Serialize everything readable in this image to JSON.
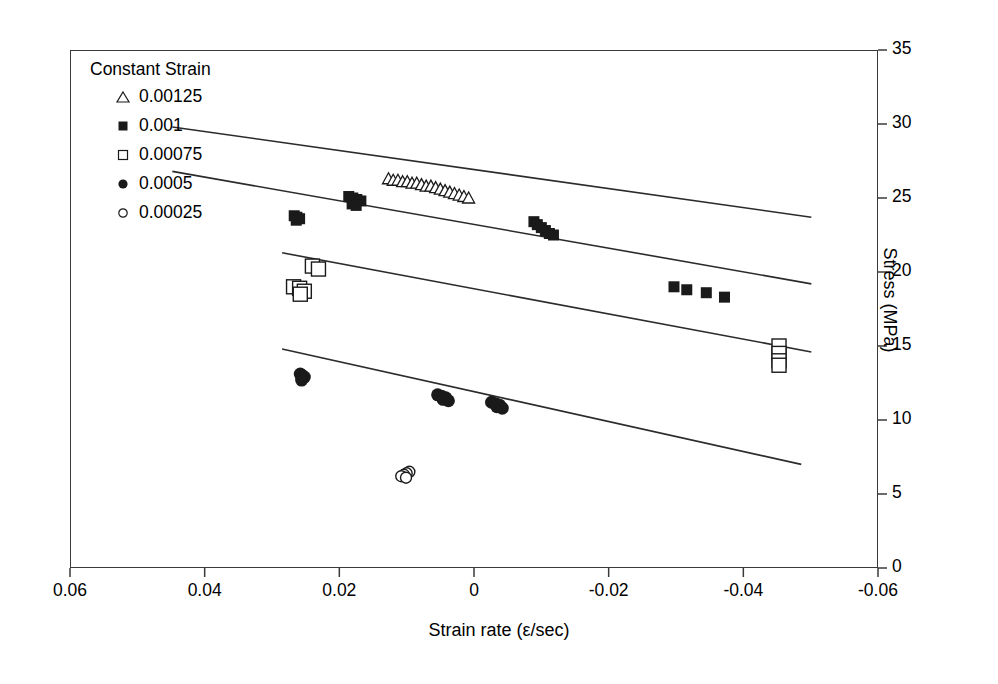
{
  "chart_data": {
    "type": "scatter",
    "title": "",
    "xlabel": "Strain rate (ε/sec)",
    "ylabel": "Stress (MPa)",
    "xlim": [
      0.06,
      -0.06
    ],
    "ylim": [
      0,
      35
    ],
    "xticks": [
      "0.06",
      "0.04",
      "0.02",
      "0",
      "-0.02",
      "-0.04",
      "-0.06"
    ],
    "xtick_values": [
      0.06,
      0.04,
      0.02,
      0,
      -0.02,
      -0.04,
      -0.06
    ],
    "yticks": [
      "0",
      "5",
      "10",
      "15",
      "20",
      "25",
      "30",
      "35"
    ],
    "ytick_values": [
      0,
      5,
      10,
      15,
      20,
      25,
      30,
      35
    ],
    "grid": false,
    "axis_notes": "x-axis reversed (decreasing left to right); y-axis drawn on right side",
    "legend": {
      "position": "top-left inside plot",
      "title": "Constant Strain",
      "entries": [
        {
          "label": "0.00125",
          "marker": "open-triangle"
        },
        {
          "label": "0.001",
          "marker": "filled-square"
        },
        {
          "label": "0.00075",
          "marker": "open-square"
        },
        {
          "label": "0.0005",
          "marker": "filled-circle"
        },
        {
          "label": "0.00025",
          "marker": "open-circle"
        }
      ]
    },
    "series": [
      {
        "name": "0.00125",
        "marker": "open-triangle",
        "points": [
          {
            "x": 0.0127,
            "y": 26.3
          },
          {
            "x": 0.012,
            "y": 26.2
          },
          {
            "x": 0.0113,
            "y": 26.2
          },
          {
            "x": 0.0106,
            "y": 26.1
          },
          {
            "x": 0.0099,
            "y": 26.1
          },
          {
            "x": 0.0092,
            "y": 26.0
          },
          {
            "x": 0.0085,
            "y": 26.0
          },
          {
            "x": 0.0078,
            "y": 25.9
          },
          {
            "x": 0.0071,
            "y": 25.8
          },
          {
            "x": 0.0064,
            "y": 25.8
          },
          {
            "x": 0.0057,
            "y": 25.7
          },
          {
            "x": 0.005,
            "y": 25.6
          },
          {
            "x": 0.0043,
            "y": 25.5
          },
          {
            "x": 0.0036,
            "y": 25.4
          },
          {
            "x": 0.0029,
            "y": 25.3
          },
          {
            "x": 0.0022,
            "y": 25.2
          },
          {
            "x": 0.0015,
            "y": 25.1
          },
          {
            "x": 0.0008,
            "y": 25.0
          }
        ]
      },
      {
        "name": "0.001",
        "marker": "filled-square",
        "points": [
          {
            "x": 0.0267,
            "y": 23.8
          },
          {
            "x": 0.0263,
            "y": 23.7
          },
          {
            "x": 0.0259,
            "y": 23.6
          },
          {
            "x": 0.0264,
            "y": 23.5
          },
          {
            "x": 0.0186,
            "y": 25.1
          },
          {
            "x": 0.018,
            "y": 25.0
          },
          {
            "x": 0.0174,
            "y": 24.9
          },
          {
            "x": 0.0168,
            "y": 24.8
          },
          {
            "x": 0.0181,
            "y": 24.6
          },
          {
            "x": 0.0175,
            "y": 24.5
          },
          {
            "x": -0.0089,
            "y": 23.4
          },
          {
            "x": -0.0094,
            "y": 23.2
          },
          {
            "x": -0.01,
            "y": 23.0
          },
          {
            "x": -0.0106,
            "y": 22.8
          },
          {
            "x": -0.0112,
            "y": 22.6
          },
          {
            "x": -0.0118,
            "y": 22.5
          },
          {
            "x": -0.0297,
            "y": 19.0
          },
          {
            "x": -0.0316,
            "y": 18.8
          },
          {
            "x": -0.0345,
            "y": 18.6
          },
          {
            "x": -0.0372,
            "y": 18.3
          }
        ]
      },
      {
        "name": "0.00075",
        "marker": "open-square",
        "points": [
          {
            "x": 0.024,
            "y": 20.4
          },
          {
            "x": 0.0231,
            "y": 20.2
          },
          {
            "x": 0.0268,
            "y": 19.0
          },
          {
            "x": 0.0259,
            "y": 18.9
          },
          {
            "x": 0.0252,
            "y": 18.7
          },
          {
            "x": 0.0258,
            "y": 18.5
          },
          {
            "x": -0.0453,
            "y": 15.0
          },
          {
            "x": -0.0453,
            "y": 14.5
          },
          {
            "x": -0.0453,
            "y": 14.0
          },
          {
            "x": -0.0453,
            "y": 13.7
          }
        ]
      },
      {
        "name": "0.0005",
        "marker": "filled-circle",
        "points": [
          {
            "x": 0.0258,
            "y": 13.1
          },
          {
            "x": 0.0255,
            "y": 13.0
          },
          {
            "x": 0.0252,
            "y": 12.9
          },
          {
            "x": 0.0256,
            "y": 12.7
          },
          {
            "x": 0.0054,
            "y": 11.7
          },
          {
            "x": 0.0048,
            "y": 11.6
          },
          {
            "x": 0.0042,
            "y": 11.5
          },
          {
            "x": 0.0046,
            "y": 11.4
          },
          {
            "x": 0.0038,
            "y": 11.3
          },
          {
            "x": -0.0026,
            "y": 11.2
          },
          {
            "x": -0.0032,
            "y": 11.1
          },
          {
            "x": -0.0038,
            "y": 11.0
          },
          {
            "x": -0.0034,
            "y": 10.9
          },
          {
            "x": -0.0042,
            "y": 10.8
          }
        ]
      },
      {
        "name": "0.00025",
        "marker": "open-circle",
        "points": [
          {
            "x": 0.0096,
            "y": 6.5
          },
          {
            "x": 0.01,
            "y": 6.4
          },
          {
            "x": 0.0104,
            "y": 6.3
          },
          {
            "x": 0.0108,
            "y": 6.2
          },
          {
            "x": 0.0101,
            "y": 6.1
          }
        ]
      }
    ],
    "trendlines": [
      {
        "name": "0.00125-fit",
        "x1": 0.0448,
        "y1": 29.8,
        "x2": -0.0501,
        "y2": 23.7
      },
      {
        "name": "0.001-fit",
        "x1": 0.0448,
        "y1": 26.8,
        "x2": -0.0501,
        "y2": 19.2
      },
      {
        "name": "0.00075-fit",
        "x1": 0.0285,
        "y1": 21.3,
        "x2": -0.0501,
        "y2": 14.6
      },
      {
        "name": "0.0005-fit",
        "x1": 0.0285,
        "y1": 14.8,
        "x2": -0.0486,
        "y2": 7.0
      }
    ],
    "colors": {
      "axis": "#3a3a3a",
      "marker": "#1a1a1a",
      "line": "#2b2b2b",
      "background": "#ffffff"
    }
  }
}
